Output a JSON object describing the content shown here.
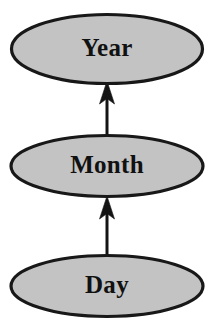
{
  "diagram": {
    "type": "hierarchy-graph",
    "background_color": "#ffffff",
    "node_fill_color": "#c3c3c3",
    "node_stroke_color": "#181818",
    "edge_color": "#141414",
    "label_color": "#111111",
    "nodes": [
      {
        "id": "year",
        "label": "Year",
        "shape": "ellipse",
        "cx": 107,
        "cy": 49,
        "rx": 96,
        "ry": 35
      },
      {
        "id": "month",
        "label": "Month",
        "shape": "ellipse",
        "cx": 107,
        "cy": 166,
        "rx": 97,
        "ry": 31
      },
      {
        "id": "day",
        "label": "Day",
        "shape": "ellipse",
        "cx": 107,
        "cy": 286,
        "rx": 97,
        "ry": 31
      }
    ],
    "edges": [
      {
        "id": "month-to-year",
        "from": "month",
        "to": "year",
        "direction": "up",
        "arrowhead": "solid-triangle"
      },
      {
        "id": "day-to-month",
        "from": "day",
        "to": "month",
        "direction": "up",
        "arrowhead": "solid-triangle"
      }
    ]
  }
}
